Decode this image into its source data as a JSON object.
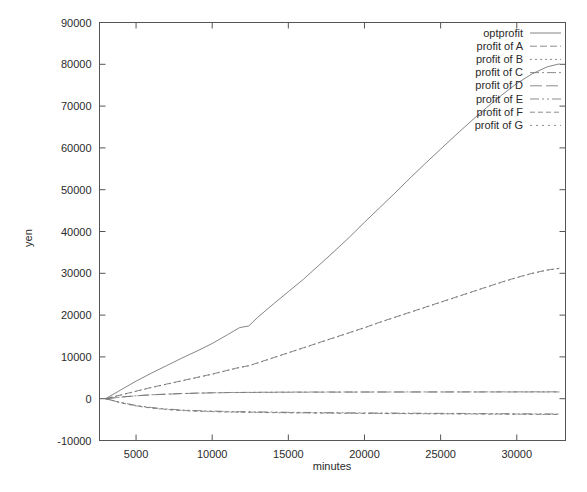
{
  "chart_data": {
    "type": "line",
    "title": "",
    "xlabel": "minutes",
    "ylabel": "yen",
    "xlim": [
      2600,
      33200
    ],
    "ylim": [
      -10000,
      90000
    ],
    "grid": false,
    "legend_position": "top-right-inside",
    "xticks": [
      5000,
      10000,
      15000,
      20000,
      25000,
      30000
    ],
    "xtick_labels": [
      "5000",
      "10000",
      "15000",
      "20000",
      "25000",
      "30000"
    ],
    "yticks": [
      -10000,
      0,
      10000,
      20000,
      30000,
      40000,
      50000,
      60000,
      70000,
      80000,
      90000
    ],
    "ytick_labels": [
      "-10000",
      "0",
      "10000",
      "20000",
      "30000",
      "40000",
      "50000",
      "60000",
      "70000",
      "80000",
      "90000"
    ],
    "legend": [
      "optprofit",
      "profit of A",
      "profit of B",
      "profit of C",
      "profit of D",
      "profit of E",
      "profit of F",
      "profit of G"
    ],
    "x": [
      3000,
      4000,
      5000,
      6000,
      7000,
      8000,
      9000,
      10000,
      11000,
      11800,
      12400,
      13000,
      14000,
      15000,
      16000,
      17000,
      18000,
      19000,
      20000,
      21000,
      22000,
      23000,
      24000,
      25000,
      26000,
      27000,
      28000,
      29000,
      30000,
      31000,
      32000,
      32800
    ],
    "series": [
      {
        "name": "optprofit",
        "dash": "solid",
        "values": [
          0,
          2100,
          4200,
          6100,
          7900,
          9700,
          11400,
          13200,
          15300,
          17000,
          17400,
          19500,
          22600,
          25600,
          28600,
          31900,
          35200,
          38600,
          42200,
          45700,
          49200,
          52800,
          56300,
          59700,
          63100,
          66400,
          69600,
          72600,
          75400,
          77700,
          79400,
          80100
        ]
      },
      {
        "name": "profit of A",
        "dash": "dash-a",
        "values": [
          0,
          900,
          1800,
          2700,
          3500,
          4300,
          5100,
          5900,
          6800,
          7500,
          7900,
          8600,
          9800,
          11000,
          12200,
          13400,
          14600,
          15800,
          17000,
          18300,
          19500,
          20700,
          21900,
          23100,
          24300,
          25500,
          26700,
          27900,
          29000,
          30000,
          30800,
          31200
        ]
      },
      {
        "name": "profit of B",
        "dash": "dot-b",
        "values": [
          0,
          880,
          1760,
          2650,
          3450,
          4250,
          5050,
          5850,
          6750,
          7450,
          7850,
          8550,
          9750,
          10950,
          12150,
          13350,
          14550,
          15750,
          16950,
          18250,
          19450,
          20650,
          21850,
          23050,
          24250,
          25450,
          26650,
          27850,
          28950,
          29950,
          30750,
          31150
        ]
      },
      {
        "name": "profit of C",
        "dash": "dashdot-c",
        "values": [
          0,
          400,
          700,
          950,
          1100,
          1250,
          1350,
          1420,
          1480,
          1510,
          1520,
          1540,
          1560,
          1580,
          1590,
          1600,
          1600,
          1610,
          1610,
          1615,
          1620,
          1620,
          1625,
          1625,
          1630,
          1630,
          1630,
          1635,
          1635,
          1640,
          1640,
          1640
        ]
      },
      {
        "name": "profit of D",
        "dash": "longdash-d",
        "values": [
          0,
          380,
          680,
          920,
          1070,
          1210,
          1310,
          1390,
          1450,
          1480,
          1490,
          1510,
          1530,
          1550,
          1560,
          1570,
          1575,
          1580,
          1585,
          1590,
          1595,
          1598,
          1600,
          1602,
          1605,
          1608,
          1610,
          1612,
          1614,
          1616,
          1618,
          1618
        ]
      },
      {
        "name": "profit of E",
        "dash": "dashdotdot-e",
        "values": [
          0,
          -900,
          -1600,
          -2100,
          -2450,
          -2700,
          -2850,
          -2950,
          -3050,
          -3100,
          -3120,
          -3150,
          -3200,
          -3250,
          -3280,
          -3310,
          -3340,
          -3370,
          -3400,
          -3420,
          -3440,
          -3460,
          -3480,
          -3500,
          -3520,
          -3540,
          -3560,
          -3580,
          -3600,
          -3620,
          -3640,
          -3650
        ]
      },
      {
        "name": "profit of F",
        "dash": "dash-f",
        "values": [
          0,
          -950,
          -1700,
          -2200,
          -2550,
          -2800,
          -2950,
          -3050,
          -3150,
          -3200,
          -3220,
          -3250,
          -3300,
          -3340,
          -3370,
          -3400,
          -3430,
          -3460,
          -3490,
          -3510,
          -3530,
          -3550,
          -3570,
          -3590,
          -3610,
          -3630,
          -3650,
          -3670,
          -3690,
          -3710,
          -3730,
          -3740
        ]
      },
      {
        "name": "profit of G",
        "dash": "dot-g",
        "values": [
          0,
          -1000,
          -1750,
          -2250,
          -2600,
          -2850,
          -3000,
          -3100,
          -3200,
          -3250,
          -3270,
          -3300,
          -3350,
          -3390,
          -3420,
          -3450,
          -3480,
          -3510,
          -3540,
          -3560,
          -3580,
          -3600,
          -3620,
          -3640,
          -3660,
          -3680,
          -3700,
          -3720,
          -3740,
          -3760,
          -3780,
          -3790
        ]
      }
    ]
  },
  "colors": {
    "background": "#ffffff",
    "axis": "#555555",
    "text": "#2b2b2b",
    "line": "#777777"
  }
}
